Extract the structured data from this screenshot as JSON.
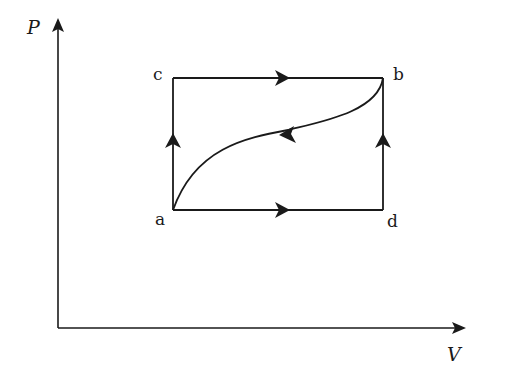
{
  "diagram": {
    "type": "PV cycle diagram",
    "axes": {
      "y_label": "P",
      "x_label": "V"
    },
    "points": [
      {
        "id": "a",
        "label": "a",
        "x": 173,
        "y": 210
      },
      {
        "id": "b",
        "label": "b",
        "x": 383,
        "y": 78
      },
      {
        "id": "c",
        "label": "c",
        "x": 173,
        "y": 78
      },
      {
        "id": "d",
        "label": "d",
        "x": 383,
        "y": 210
      }
    ],
    "paths": [
      {
        "from": "a",
        "to": "c",
        "shape": "vertical line",
        "direction": "up"
      },
      {
        "from": "c",
        "to": "b",
        "shape": "horizontal line",
        "direction": "right"
      },
      {
        "from": "a",
        "to": "d",
        "shape": "horizontal line",
        "direction": "right"
      },
      {
        "from": "d",
        "to": "b",
        "shape": "vertical line",
        "direction": "up"
      },
      {
        "from": "b",
        "to": "a",
        "shape": "curve",
        "direction": "toward a"
      }
    ],
    "colors": {
      "line": "#1a1a1a",
      "background": "#ffffff"
    }
  }
}
